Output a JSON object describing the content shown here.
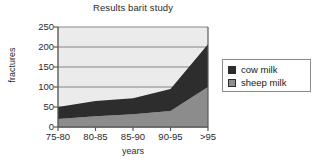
{
  "chart_data": {
    "type": "area",
    "stacked": true,
    "title": "Results barit study",
    "xlabel": "years",
    "ylabel": "fractures",
    "categories": [
      "75-80",
      "80-85",
      "85-90",
      "90-95",
      ">95"
    ],
    "series": [
      {
        "name": "cow milk",
        "values": [
          30,
          38,
          40,
          55,
          107
        ],
        "color": "#2d2d2d"
      },
      {
        "name": "sheep milk",
        "values": [
          20,
          27,
          32,
          40,
          100
        ],
        "color": "#8c8c8c"
      }
    ],
    "stack_totals": [
      50,
      65,
      72,
      95,
      207
    ],
    "yticks": [
      0,
      50,
      100,
      150,
      200,
      250
    ],
    "ylim": [
      0,
      250
    ],
    "grid": true,
    "legend_position": "right",
    "plot_background": "#ebebeb"
  },
  "legend": {
    "items": [
      {
        "label": "cow milk",
        "swatch": "#2d2d2d"
      },
      {
        "label": "sheep milk",
        "swatch": "#8c8c8c"
      }
    ]
  },
  "axes": {
    "yticks": [
      "250",
      "200",
      "150",
      "100",
      "50",
      "0"
    ],
    "xticks": [
      "75-80",
      "80-85",
      "85-90",
      "90-95",
      ">95"
    ]
  },
  "colors": {
    "cow_milk": "#2d2d2d",
    "sheep_milk": "#8c8c8c",
    "plot_bg": "#ebebeb",
    "axis": "#5a5a5a",
    "grid": "#7a7a7a",
    "text": "#1a1a1a"
  }
}
